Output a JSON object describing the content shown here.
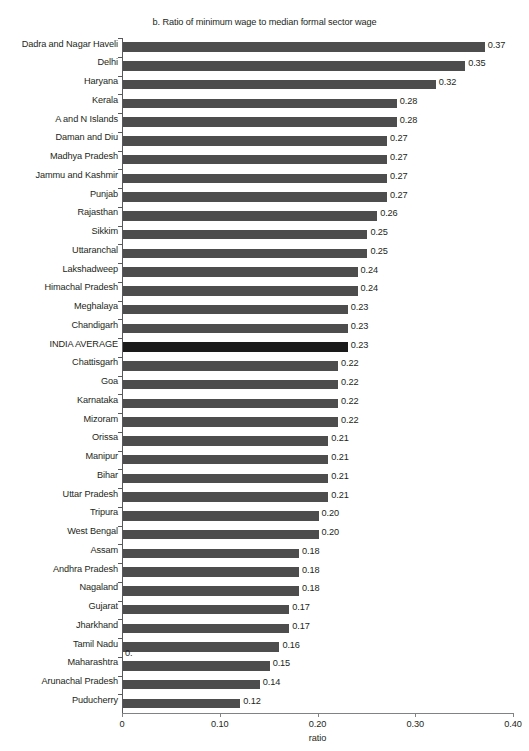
{
  "chart_data": {
    "type": "bar",
    "orientation": "horizontal",
    "title": "b. Ratio of minimum wage to median formal sector wage",
    "xlabel": "ratio",
    "ylabel": "",
    "xlim": [
      0,
      0.4
    ],
    "xticks": [
      "0",
      "0.10",
      "0.20",
      "0.30",
      "0.40"
    ],
    "xtick_values": [
      0,
      0.1,
      0.2,
      0.3,
      0.4
    ],
    "grid": false,
    "legend": null,
    "categories": [
      "Dadra and Nagar Haveli",
      "Delhi",
      "Haryana",
      "Kerala",
      "A and N Islands",
      "Daman and Diu",
      "Madhya Pradesh",
      "Jammu and Kashmir",
      "Punjab",
      "Rajasthan",
      "Sikkim",
      "Uttaranchal",
      "Lakshadweep",
      "Himachal Pradesh",
      "Meghalaya",
      "Chandigarh",
      "INDIA AVERAGE",
      "Chattisgarh",
      "Goa",
      "Karnataka",
      "Mizoram",
      "Orissa",
      "Manipur",
      "Bihar",
      "Uttar Pradesh",
      "Tripura",
      "West Bengal",
      "Assam",
      "Andhra Pradesh",
      "Nagaland",
      "Gujarat",
      "Jharkhand",
      "Tamil Nadu",
      "Maharashtra",
      "Arunachal Pradesh",
      "Puducherry"
    ],
    "values": [
      0.37,
      0.35,
      0.32,
      0.28,
      0.28,
      0.27,
      0.27,
      0.27,
      0.27,
      0.26,
      0.25,
      0.25,
      0.24,
      0.24,
      0.23,
      0.23,
      0.23,
      0.22,
      0.22,
      0.22,
      0.22,
      0.21,
      0.21,
      0.21,
      0.21,
      0.2,
      0.2,
      0.18,
      0.18,
      0.18,
      0.17,
      0.17,
      0.16,
      0.15,
      0.14,
      0.12
    ],
    "value_labels": [
      "0.37",
      "0.35",
      "0.32",
      "0.28",
      "0.28",
      "0.27",
      "0.27",
      "0.27",
      "0.27",
      "0.26",
      "0.25",
      "0.25",
      "0.24",
      "0.24",
      "0.23",
      "0.23",
      "0.23",
      "0.22",
      "0.22",
      "0.22",
      "0.22",
      "0.21",
      "0.21",
      "0.21",
      "0.21",
      "0.20",
      "0.20",
      "0.18",
      "0.18",
      "0.18",
      "0.17",
      "0.17",
      "0.16",
      "0.15",
      "0.14",
      "0.12"
    ],
    "highlight_category": "INDIA AVERAGE",
    "colors": {
      "bar": "#4d4d4d",
      "highlight_bar": "#1a1a1a",
      "axis": "#58595b",
      "text": "#231f20",
      "background": "#ffffff"
    },
    "annotations": [
      {
        "text": "0.",
        "note": "stray truncated label near Tamil Nadu row"
      }
    ]
  }
}
